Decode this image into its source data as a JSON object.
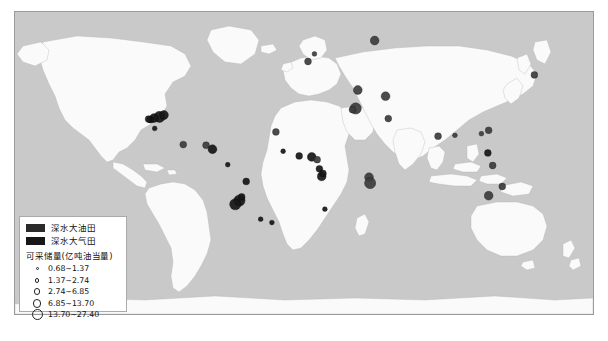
{
  "figure": {
    "caption": "",
    "ocean_color": "#c9c9c9",
    "land_color": "#fafafa",
    "marker_color": "#171717",
    "frame_color": "#9a9a9a"
  },
  "legend": {
    "oil_label": "深水大油田",
    "gas_label": "深水大气田",
    "size_title": "可采储量(亿吨油当量)",
    "size_classes": [
      {
        "label": "0.68~1.37",
        "d": 3.0
      },
      {
        "label": "1.37~2.74",
        "d": 4.6
      },
      {
        "label": "2.74~6.85",
        "d": 6.6
      },
      {
        "label": "6.85~13.70",
        "d": 8.6
      },
      {
        "label": "13.70~27.40",
        "d": 11.0
      }
    ]
  },
  "chart_data": {
    "type": "scatter",
    "xlabel": "",
    "ylabel": "",
    "projection": "equirectangular",
    "xlim": [
      -180,
      180
    ],
    "ylim": [
      -90,
      90
    ],
    "grid": false,
    "legend_position": "bottom-left",
    "value_unit": "亿吨油当量",
    "size_bins": [
      0.68,
      1.37,
      2.74,
      6.85,
      13.7,
      27.4
    ],
    "points": [
      {
        "name": "Gulf of Mexico - Mississippi Canyon",
        "x": -90.0,
        "y": 27.5,
        "v": 18.0,
        "kind": "oil"
      },
      {
        "name": "Gulf of Mexico - Green Canyon",
        "x": -93.5,
        "y": 26.8,
        "v": 9.0,
        "kind": "oil"
      },
      {
        "name": "Gulf of Mexico - Alaminos Canyon",
        "x": -95.6,
        "y": 25.8,
        "v": 5.0,
        "kind": "oil"
      },
      {
        "name": "Gulf of Mexico - De Soto Canyon",
        "x": -87.2,
        "y": 28.6,
        "v": 7.5,
        "kind": "oil"
      },
      {
        "name": "Gulf of Mexico - Perdido",
        "x": -96.8,
        "y": 26.2,
        "v": 3.0,
        "kind": "oil"
      },
      {
        "name": "Campeche Deepwater",
        "x": -93.0,
        "y": 20.6,
        "v": 2.2,
        "kind": "oil"
      },
      {
        "name": "Caribbean - Trinidad",
        "x": -61.0,
        "y": 10.6,
        "v": 5.5,
        "kind": "gas"
      },
      {
        "name": "Colombia Caribbean Deepwater",
        "x": -75.2,
        "y": 11.0,
        "v": 3.2,
        "kind": "gas"
      },
      {
        "name": "Guyana - Stabroek",
        "x": -57.0,
        "y": 8.2,
        "v": 9.5,
        "kind": "oil"
      },
      {
        "name": "Brazil - Foz do Amazonas",
        "x": -47.5,
        "y": -1.0,
        "v": 2.4,
        "kind": "oil"
      },
      {
        "name": "Brazil - Sergipe-Alagoas",
        "x": -36.0,
        "y": -11.0,
        "v": 3.0,
        "kind": "oil"
      },
      {
        "name": "Brazil - Campos Basin",
        "x": -40.2,
        "y": -22.4,
        "v": 16.0,
        "kind": "oil"
      },
      {
        "name": "Brazil - Santos Basin (Tupi)",
        "x": -42.8,
        "y": -24.6,
        "v": 22.0,
        "kind": "oil"
      },
      {
        "name": "Brazil - Espirito Santo",
        "x": -38.8,
        "y": -20.2,
        "v": 6.0,
        "kind": "oil"
      },
      {
        "name": "South Atlantic A",
        "x": -27.0,
        "y": -33.5,
        "v": 1.6,
        "kind": "oil"
      },
      {
        "name": "South Atlantic B",
        "x": -20.0,
        "y": -35.5,
        "v": 1.8,
        "kind": "oil"
      },
      {
        "name": "Mauritania - Senegal",
        "x": -17.5,
        "y": 18.5,
        "v": 6.5,
        "kind": "gas"
      },
      {
        "name": "Sierra Leone - Liberia Margin",
        "x": -13.0,
        "y": 7.0,
        "v": 2.0,
        "kind": "oil"
      },
      {
        "name": "Cote d'Ivoire - Ghana (Jubilee)",
        "x": -3.0,
        "y": 4.2,
        "v": 4.0,
        "kind": "oil"
      },
      {
        "name": "Nigeria Deepwater (Bonga/Agbami)",
        "x": 4.8,
        "y": 3.6,
        "v": 12.0,
        "kind": "oil"
      },
      {
        "name": "Equatorial Guinea",
        "x": 8.2,
        "y": 2.0,
        "v": 3.2,
        "kind": "gas"
      },
      {
        "name": "Congo - Gabon Deepwater",
        "x": 9.6,
        "y": -3.5,
        "v": 4.4,
        "kind": "oil"
      },
      {
        "name": "Angola Block 17/18",
        "x": 11.0,
        "y": -8.0,
        "v": 10.5,
        "kind": "oil"
      },
      {
        "name": "Angola Lower Congo",
        "x": 11.8,
        "y": -6.2,
        "v": 3.0,
        "kind": "oil"
      },
      {
        "name": "Namibia - Orange Basin",
        "x": 13.0,
        "y": -27.5,
        "v": 2.0,
        "kind": "oil"
      },
      {
        "name": "North Sea Deepwater",
        "x": 2.5,
        "y": 60.5,
        "v": 4.5,
        "kind": "gas"
      },
      {
        "name": "Norwegian Sea",
        "x": 6.5,
        "y": 65.0,
        "v": 2.2,
        "kind": "gas"
      },
      {
        "name": "Barents Sea (Shtokman)",
        "x": 44.0,
        "y": 73.0,
        "v": 13.5,
        "kind": "gas"
      },
      {
        "name": "Black Sea Deepwater",
        "x": 33.5,
        "y": 43.5,
        "v": 8.5,
        "kind": "gas"
      },
      {
        "name": "Eastern Mediterranean (Zohr/Leviathan)",
        "x": 32.2,
        "y": 32.5,
        "v": 14.0,
        "kind": "gas"
      },
      {
        "name": "Nile Delta Deepwater",
        "x": 30.2,
        "y": 31.8,
        "v": 5.0,
        "kind": "gas"
      },
      {
        "name": "Caspian - Shah Deniz",
        "x": 50.8,
        "y": 39.8,
        "v": 9.0,
        "kind": "gas"
      },
      {
        "name": "Persian Gulf Deepwater",
        "x": 52.5,
        "y": 26.5,
        "v": 3.0,
        "kind": "gas"
      },
      {
        "name": "Tanzania Deepwater",
        "x": 40.5,
        "y": -8.5,
        "v": 7.0,
        "kind": "gas"
      },
      {
        "name": "Mozambique - Rovuma Basin",
        "x": 41.2,
        "y": -12.0,
        "v": 24.0,
        "kind": "gas"
      },
      {
        "name": "Bay of Bengal - Krishna Godavari",
        "x": 83.5,
        "y": 16.0,
        "v": 3.5,
        "kind": "gas"
      },
      {
        "name": "Myanmar Offshore",
        "x": 94.0,
        "y": 16.5,
        "v": 2.0,
        "kind": "gas"
      },
      {
        "name": "South China Sea - Pearl River Mouth",
        "x": 115.0,
        "y": 19.5,
        "v": 4.0,
        "kind": "gas"
      },
      {
        "name": "South China Sea - Qiongdongnan",
        "x": 110.5,
        "y": 17.5,
        "v": 2.6,
        "kind": "gas"
      },
      {
        "name": "Sabah - Sarawak Deepwater",
        "x": 114.5,
        "y": 6.0,
        "v": 3.4,
        "kind": "oil"
      },
      {
        "name": "Makassar Strait Deepwater",
        "x": 117.5,
        "y": -1.5,
        "v": 3.0,
        "kind": "gas"
      },
      {
        "name": "Northwest Shelf Australia (Gorgon)",
        "x": 115.0,
        "y": -19.5,
        "v": 11.5,
        "kind": "gas"
      },
      {
        "name": "Browse Basin Australia",
        "x": 123.5,
        "y": -14.0,
        "v": 5.5,
        "kind": "gas"
      },
      {
        "name": "Sakhalin Deepwater",
        "x": 143.5,
        "y": 52.5,
        "v": 4.0,
        "kind": "gas"
      }
    ]
  }
}
